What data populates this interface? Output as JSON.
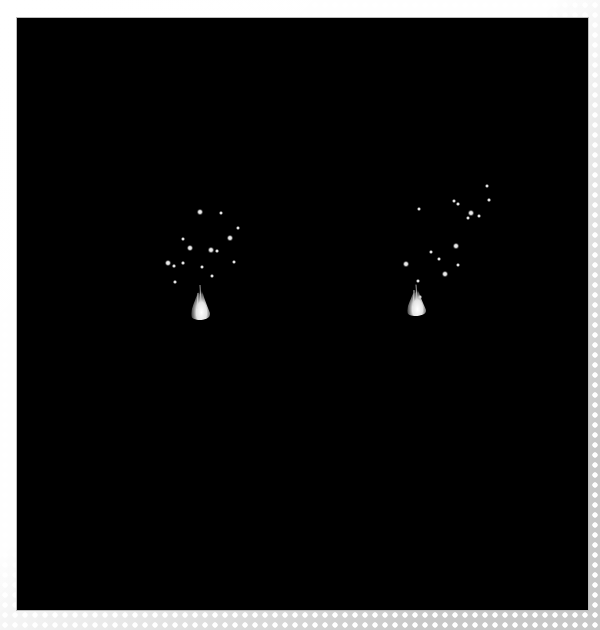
{
  "image": {
    "description": "Stereo pair of night-sky/particle images: two bright flame-like sources each surrounded by scattered point lights on a black background",
    "background_color": "#000000",
    "border_color": "#bdbdbd",
    "panels": [
      {
        "label": "left-view",
        "flame": {
          "x": 193,
          "y": 312,
          "width": 14,
          "height": 34
        },
        "dots": [
          {
            "x": 200,
            "y": 212,
            "r": 2.2
          },
          {
            "x": 221,
            "y": 213,
            "r": 1.5
          },
          {
            "x": 238,
            "y": 228,
            "r": 1.5
          },
          {
            "x": 230,
            "y": 238,
            "r": 2.2
          },
          {
            "x": 190,
            "y": 248,
            "r": 2.6
          },
          {
            "x": 183,
            "y": 239,
            "r": 1.5
          },
          {
            "x": 211,
            "y": 250,
            "r": 2.0
          },
          {
            "x": 217,
            "y": 251,
            "r": 1.3
          },
          {
            "x": 234,
            "y": 262,
            "r": 1.8
          },
          {
            "x": 168,
            "y": 263,
            "r": 2.6
          },
          {
            "x": 174,
            "y": 266,
            "r": 1.2
          },
          {
            "x": 183,
            "y": 263,
            "r": 1.2
          },
          {
            "x": 202,
            "y": 267,
            "r": 1.5
          },
          {
            "x": 212,
            "y": 276,
            "r": 1.5
          },
          {
            "x": 175,
            "y": 282,
            "r": 1.3
          }
        ]
      },
      {
        "label": "right-view",
        "flame": {
          "x": 409,
          "y": 308,
          "width": 14,
          "height": 30
        },
        "dots": [
          {
            "x": 487,
            "y": 186,
            "r": 1.5
          },
          {
            "x": 489,
            "y": 200,
            "r": 1.3
          },
          {
            "x": 454,
            "y": 201,
            "r": 1.8
          },
          {
            "x": 458,
            "y": 204,
            "r": 1.3
          },
          {
            "x": 419,
            "y": 209,
            "r": 1.5
          },
          {
            "x": 471,
            "y": 213,
            "r": 2.0
          },
          {
            "x": 468,
            "y": 218,
            "r": 1.5
          },
          {
            "x": 479,
            "y": 216,
            "r": 1.5
          },
          {
            "x": 456,
            "y": 246,
            "r": 2.0
          },
          {
            "x": 431,
            "y": 252,
            "r": 1.5
          },
          {
            "x": 439,
            "y": 259,
            "r": 1.5
          },
          {
            "x": 406,
            "y": 264,
            "r": 2.2
          },
          {
            "x": 458,
            "y": 265,
            "r": 1.5
          },
          {
            "x": 445,
            "y": 274,
            "r": 2.2
          },
          {
            "x": 418,
            "y": 281,
            "r": 1.5
          },
          {
            "x": 420,
            "y": 297,
            "r": 1.2
          },
          {
            "x": 414,
            "y": 291,
            "r": 1.0
          }
        ]
      }
    ]
  }
}
